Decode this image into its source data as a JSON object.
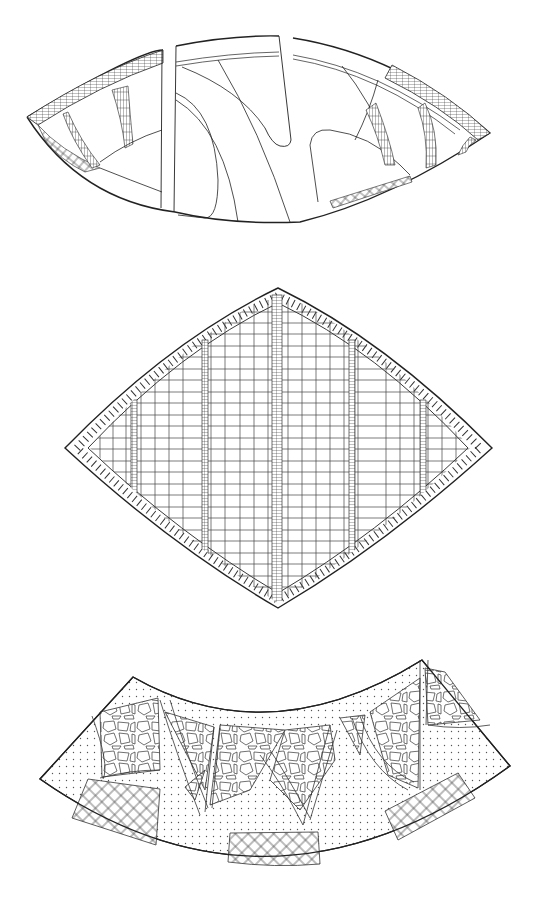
{
  "canvas": {
    "width": 546,
    "height": 904,
    "background": "#ffffff"
  },
  "colors": {
    "stroke": "#222222",
    "fine_stroke": "#444444",
    "dot": "#555555"
  },
  "figures": [
    {
      "id": "lens-pattern",
      "kind": "paving-plan",
      "pattern": "curved lens with brick bands, checker corner and serpentine paths"
    },
    {
      "id": "diamond-pattern",
      "kind": "paving-plan",
      "pattern": "curved diamond with brick border, rectangular grid and narrow brick strips"
    },
    {
      "id": "arc-pattern",
      "kind": "paving-plan",
      "pattern": "annular arc band with crazy-paving triangles, dotted gravel and diagonal lattice panels"
    }
  ]
}
